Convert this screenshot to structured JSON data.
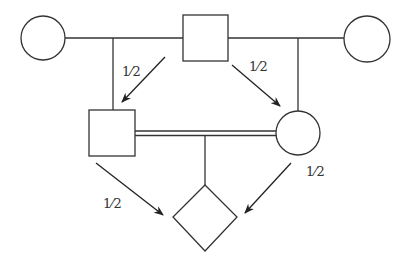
{
  "diagram": {
    "type": "pedigree-chart",
    "nodes": [
      {
        "id": "grandmother-left",
        "shape": "circle",
        "sex": "female"
      },
      {
        "id": "common-ancestor",
        "shape": "square",
        "sex": "male"
      },
      {
        "id": "grandmother-right",
        "shape": "circle",
        "sex": "female"
      },
      {
        "id": "father",
        "shape": "square",
        "sex": "male"
      },
      {
        "id": "mother",
        "shape": "circle",
        "sex": "female"
      },
      {
        "id": "offspring",
        "shape": "diamond",
        "sex": "unknown"
      }
    ],
    "edges": [
      {
        "from": "common-ancestor",
        "to": "father",
        "label": "1/2"
      },
      {
        "from": "common-ancestor",
        "to": "mother",
        "label": "1/2"
      },
      {
        "from": "father",
        "to": "offspring",
        "label": "1/2"
      },
      {
        "from": "mother",
        "to": "offspring",
        "label": "1/2"
      }
    ],
    "labels": {
      "ancestor_to_father": "1⁄2",
      "ancestor_to_mother": "1⁄2",
      "father_to_offspring": "1⁄2",
      "mother_to_offspring": "1⁄2"
    },
    "consanguineous_mating": "father × mother (double line)",
    "colors": {
      "stroke": "#333333",
      "background": "#ffffff"
    }
  }
}
